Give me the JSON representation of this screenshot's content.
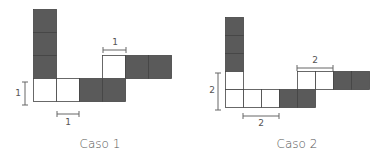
{
  "colors": {
    "dark": "#5a5a5a",
    "light": "#ffffff",
    "stroke": "#444444",
    "dim": "#666666"
  },
  "case1": {
    "caption": "Caso 1",
    "unit_px": 23,
    "dim_horizontal_bottom": "1",
    "dim_horizontal_top": "1",
    "dim_vertical": "1",
    "cells": [
      {
        "col": 0,
        "row": 0,
        "fill": "dark"
      },
      {
        "col": 0,
        "row": 1,
        "fill": "dark"
      },
      {
        "col": 0,
        "row": 2,
        "fill": "dark"
      },
      {
        "col": 0,
        "row": 3,
        "fill": "light"
      },
      {
        "col": 1,
        "row": 3,
        "fill": "light"
      },
      {
        "col": 2,
        "row": 3,
        "fill": "dark"
      },
      {
        "col": 3,
        "row": 3,
        "fill": "dark"
      },
      {
        "col": 3,
        "row": 2,
        "fill": "light"
      },
      {
        "col": 4,
        "row": 2,
        "fill": "dark"
      },
      {
        "col": 5,
        "row": 2,
        "fill": "dark"
      }
    ]
  },
  "case2": {
    "caption": "Caso 2",
    "unit_px": 18,
    "dim_horizontal_bottom": "2",
    "dim_horizontal_top": "2",
    "dim_vertical": "2",
    "cells": [
      {
        "col": 0,
        "row": 0,
        "fill": "dark"
      },
      {
        "col": 0,
        "row": 1,
        "fill": "dark"
      },
      {
        "col": 0,
        "row": 2,
        "fill": "dark"
      },
      {
        "col": 0,
        "row": 3,
        "fill": "light"
      },
      {
        "col": 0,
        "row": 4,
        "fill": "light"
      },
      {
        "col": 1,
        "row": 4,
        "fill": "light"
      },
      {
        "col": 2,
        "row": 4,
        "fill": "light"
      },
      {
        "col": 3,
        "row": 4,
        "fill": "dark"
      },
      {
        "col": 4,
        "row": 4,
        "fill": "dark"
      },
      {
        "col": 4,
        "row": 3,
        "fill": "light"
      },
      {
        "col": 5,
        "row": 3,
        "fill": "light"
      },
      {
        "col": 6,
        "row": 3,
        "fill": "dark"
      },
      {
        "col": 7,
        "row": 3,
        "fill": "dark"
      }
    ]
  }
}
